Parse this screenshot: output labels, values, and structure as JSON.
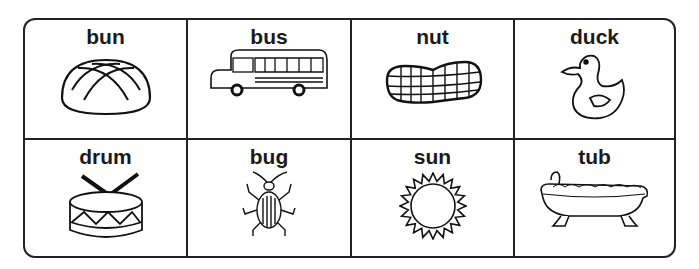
{
  "worksheet": {
    "cells": [
      {
        "word": "bun",
        "icon": "bun-icon"
      },
      {
        "word": "bus",
        "icon": "bus-icon"
      },
      {
        "word": "nut",
        "icon": "nut-icon"
      },
      {
        "word": "duck",
        "icon": "duck-icon"
      },
      {
        "word": "drum",
        "icon": "drum-icon"
      },
      {
        "word": "bug",
        "icon": "bug-icon"
      },
      {
        "word": "sun",
        "icon": "sun-icon"
      },
      {
        "word": "tub",
        "icon": "tub-icon"
      }
    ]
  }
}
